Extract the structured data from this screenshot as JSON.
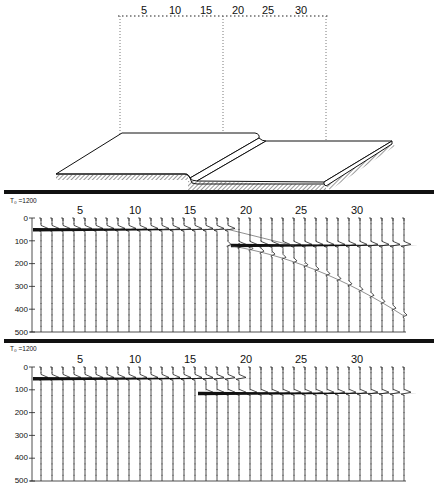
{
  "model_diagram": {
    "top_scale_labels": [
      "5",
      "10",
      "15",
      "20",
      "25",
      "30"
    ],
    "description": "Perspective block diagram of a stepped layer (fault step) with dotted projection box"
  },
  "panels": [
    {
      "id": "upper",
      "t0_label": "T₀ =1200",
      "trace_labels": [
        "5",
        "10",
        "15",
        "20",
        "25",
        "30"
      ],
      "y_axis_ticks": [
        "0",
        "100",
        "200",
        "300",
        "400",
        "500"
      ]
    },
    {
      "id": "lower",
      "t0_label": "T₀ =1200",
      "trace_labels": [
        "5",
        "10",
        "15",
        "20",
        "25",
        "30"
      ],
      "y_axis_ticks": [
        "0",
        "100",
        "200",
        "300",
        "400",
        "500"
      ]
    }
  ],
  "chart_data": [
    {
      "type": "line",
      "title": "Synthetic seismogram section (upper panel)",
      "xlabel": "Trace number",
      "ylabel": "Time",
      "trace_count": 34,
      "x_tick_labels": [
        "5",
        "10",
        "15",
        "20",
        "25",
        "30"
      ],
      "ylim": [
        0,
        500
      ],
      "y_ticks": [
        0,
        100,
        200,
        300,
        400,
        500
      ],
      "annotations": [
        "T0 = 1200"
      ],
      "series": [
        {
          "name": "upper reflector",
          "traces": [
            1,
            18
          ],
          "time": 50
        },
        {
          "name": "lower reflector",
          "traces": [
            19,
            34
          ],
          "time": 120
        },
        {
          "name": "diffraction",
          "traces": [
            18,
            34
          ],
          "time_start": 120,
          "time_end": 430
        }
      ]
    },
    {
      "type": "line",
      "title": "Synthetic seismogram section (lower panel)",
      "xlabel": "Trace number",
      "ylabel": "Time",
      "trace_count": 34,
      "x_tick_labels": [
        "5",
        "10",
        "15",
        "20",
        "25",
        "30"
      ],
      "ylim": [
        0,
        500
      ],
      "y_ticks": [
        0,
        100,
        200,
        300,
        400,
        500
      ],
      "annotations": [
        "T0 = 1200"
      ],
      "series": [
        {
          "name": "upper reflector",
          "traces": [
            1,
            19
          ],
          "time": 50
        },
        {
          "name": "lower reflector",
          "traces": [
            16,
            34
          ],
          "time": 115
        }
      ]
    }
  ]
}
